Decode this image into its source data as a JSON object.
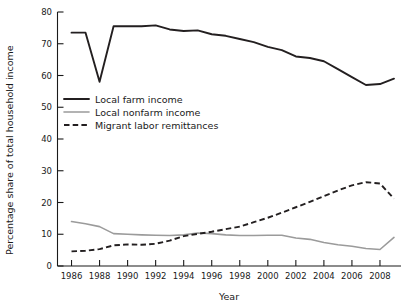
{
  "chart_data": {
    "type": "line",
    "title": "",
    "xlabel": "Year",
    "ylabel": "Percentage share of total household income",
    "xlim": [
      1985,
      2009.5
    ],
    "ylim": [
      0,
      80
    ],
    "grid": false,
    "legend_position": "upper-left-inside",
    "x": [
      1986,
      1987,
      1988,
      1989,
      1990,
      1991,
      1992,
      1993,
      1994,
      1995,
      1996,
      1997,
      1998,
      1999,
      2000,
      2001,
      2002,
      2003,
      2004,
      2005,
      2006,
      2007,
      2008,
      2009
    ],
    "xticks": [
      1986,
      1988,
      1990,
      1992,
      1994,
      1996,
      1998,
      2000,
      2002,
      2004,
      2006,
      2008
    ],
    "xticklabels": [
      "1986",
      "1988",
      "1990",
      "1992",
      "1994",
      "1996",
      "1998",
      "2000",
      "2002",
      "2004",
      "2006",
      "2008"
    ],
    "yticks": [
      0,
      10,
      20,
      30,
      40,
      50,
      60,
      70,
      80
    ],
    "yticklabels": [
      "0",
      "10",
      "20",
      "30",
      "40",
      "50",
      "60",
      "70",
      "80"
    ],
    "series": [
      {
        "name": "Local farm income",
        "style": "solid",
        "color": "#231f20",
        "values": [
          73.5,
          73.5,
          58.0,
          75.5,
          75.5,
          75.5,
          75.8,
          74.5,
          74.0,
          74.2,
          73.0,
          72.5,
          71.5,
          70.5,
          69.0,
          68.0,
          66.0,
          65.5,
          64.5,
          62.0,
          59.5,
          57.0,
          57.3,
          59.0
        ]
      },
      {
        "name": "Local nonfarm income",
        "style": "solid",
        "color": "#9b9b9b",
        "values": [
          14.0,
          13.3,
          12.4,
          10.2,
          10.0,
          9.8,
          9.7,
          9.6,
          9.8,
          10.4,
          10.2,
          9.8,
          9.6,
          9.6,
          9.7,
          9.7,
          8.8,
          8.4,
          7.4,
          6.7,
          6.2,
          5.5,
          5.2,
          9.0
        ]
      },
      {
        "name": "Migrant labor remittances",
        "style": "dashed",
        "color": "#231f20",
        "values": [
          4.6,
          4.8,
          5.3,
          6.5,
          6.8,
          6.7,
          7.0,
          8.0,
          9.4,
          10.1,
          10.8,
          11.6,
          12.4,
          13.8,
          15.2,
          16.8,
          18.5,
          20.2,
          22.0,
          23.8,
          25.4,
          26.4,
          26.0,
          21.2
        ]
      }
    ]
  },
  "legend": {
    "items": [
      {
        "label": "Local farm income",
        "key": "farm"
      },
      {
        "label": "Local nonfarm income",
        "key": "nonfarm"
      },
      {
        "label": "Migrant labor remittances",
        "key": "remit"
      }
    ]
  }
}
